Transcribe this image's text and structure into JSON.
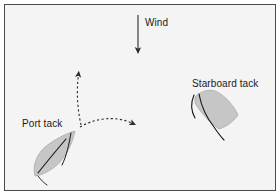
{
  "diagram": {
    "background_color": "#f4f4f4",
    "border_color": "#4a4a4a",
    "page_color": "#ffffff",
    "labels": {
      "wind": "Wind",
      "port_tack": "Port tack",
      "starboard_tack": "Starboard tack"
    },
    "wind_arrow": {
      "name": "wind-direction-arrow",
      "direction": "down",
      "color": "#2b2b2b",
      "start_x": 137,
      "start_y": 14,
      "end_x": 137,
      "end_y": 53
    },
    "boats": [
      {
        "name": "port-tack-boat",
        "label": "Port tack",
        "fill_color": "#c6c6c6",
        "outline_color": "#9a9a9a",
        "detail_color": "#1a1a1a",
        "heading": "up-right"
      },
      {
        "name": "starboard-tack-boat",
        "label": "Starboard tack",
        "fill_color": "#c6c6c6",
        "outline_color": "#9a9a9a",
        "detail_color": "#1a1a1a",
        "heading": "down-right"
      }
    ],
    "course_arrows": [
      {
        "name": "course-arrow-upwind",
        "style": "dashed",
        "color": "#2b2b2b",
        "from_x": 80,
        "from_y": 124,
        "to_x": 78,
        "to_y": 67,
        "description": "curved dashed arrow heading up and slightly left"
      },
      {
        "name": "course-arrow-crosswind",
        "style": "dashed",
        "color": "#2b2b2b",
        "from_x": 80,
        "from_y": 124,
        "to_x": 139,
        "to_y": 125,
        "description": "curved dashed arrow heading right"
      }
    ]
  }
}
